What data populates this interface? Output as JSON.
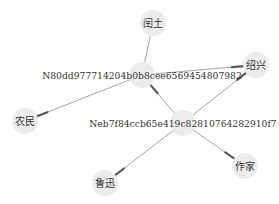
{
  "diagram": {
    "type": "directed-graph",
    "colors": {
      "node_fill": "#ececec",
      "edge": "#8a8a8a",
      "arrow": "#5a5a5a",
      "label": "#333333"
    },
    "nodes": [
      {
        "id": "runtu",
        "label": "闰土",
        "cjk": true
      },
      {
        "id": "n80dd",
        "label": "N80dd977714204b0b8cee6569454807982",
        "cjk": false
      },
      {
        "id": "shaoxing",
        "label": "绍兴",
        "cjk": true
      },
      {
        "id": "nongmin",
        "label": "农民",
        "cjk": true
      },
      {
        "id": "neb7f",
        "label": "Neb7f84ccb65e419c828107642829​10f7",
        "cjk": false
      },
      {
        "id": "luxun",
        "label": "鲁迅",
        "cjk": true
      },
      {
        "id": "zuojia",
        "label": "作家",
        "cjk": true
      }
    ],
    "edges": [
      {
        "source": "n80dd",
        "target": "runtu",
        "arrow": false
      },
      {
        "source": "n80dd",
        "target": "shaoxing",
        "arrow": true
      },
      {
        "source": "n80dd",
        "target": "nongmin",
        "arrow": true
      },
      {
        "source": "neb7f",
        "target": "n80dd",
        "arrow": true
      },
      {
        "source": "neb7f",
        "target": "shaoxing",
        "arrow": true
      },
      {
        "source": "neb7f",
        "target": "luxun",
        "arrow": true
      },
      {
        "source": "neb7f",
        "target": "zuojia",
        "arrow": true
      }
    ]
  }
}
